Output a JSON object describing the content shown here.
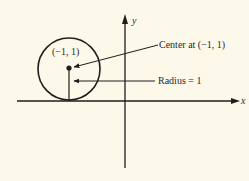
{
  "diagram": {
    "type": "circle-on-axes",
    "axes": {
      "x_label": "x",
      "y_label": "y"
    },
    "circle": {
      "center": [
        -1,
        1
      ],
      "radius": 1,
      "center_label": "(−1, 1)"
    },
    "annotations": {
      "center": "Center at (−1, 1)",
      "radius": "Radius = 1"
    },
    "colors": {
      "background": "#fcf8ea",
      "ink": "#1e1e1e"
    }
  }
}
